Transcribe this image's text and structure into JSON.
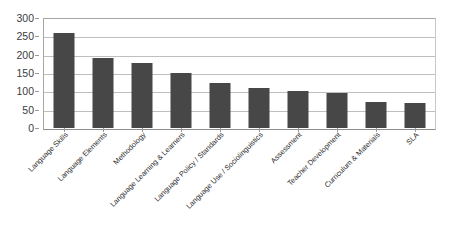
{
  "chart_data": {
    "type": "bar",
    "title": "",
    "subtitle": "",
    "xlabel": "",
    "ylabel": "",
    "grid": "horizontal",
    "legend": "none",
    "orientation": "vertical",
    "bar_color": "#474747",
    "gridline_color": "#bfbfbf",
    "ylim": [
      0,
      300
    ],
    "ytick_interval": 50,
    "yticks": [
      300,
      250,
      200,
      150,
      100,
      50,
      0
    ],
    "ytick_labels": [
      "300",
      "250",
      "200",
      "150",
      "100",
      "50",
      "0"
    ],
    "categories": [
      "Language Skills",
      "Language Elements",
      "Methodology",
      "Language Learning & Learners",
      "Language Policy / Standards",
      "Language Use / Sociolinguistics",
      "Assessment",
      "Teacher Development",
      "Curriculum & Materials",
      "SLA"
    ],
    "values": [
      260,
      190,
      178,
      150,
      123,
      110,
      101,
      95,
      72,
      67
    ],
    "series": [
      {
        "name": "Count",
        "values": [
          260,
          190,
          178,
          150,
          123,
          110,
          101,
          95,
          72,
          67
        ]
      }
    ]
  }
}
